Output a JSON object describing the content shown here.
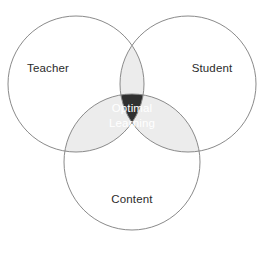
{
  "diagram": {
    "type": "venn-3-circle",
    "title": "",
    "background_color": "#ffffff",
    "stroke_color": "#8a8a8a",
    "circle_fill": "#ffffff",
    "pair_overlap_color": "#ececec",
    "triple_overlap_color": "#303030",
    "label_color": "#2b2b2b",
    "center_label_color": "#ffffff",
    "sets": [
      {
        "id": "teacher",
        "label": "Teacher",
        "position": "top-left",
        "cx": 76,
        "cy": 84,
        "r": 68,
        "label_x": 48,
        "label_y": 72
      },
      {
        "id": "student",
        "label": "Student",
        "position": "top-right",
        "cx": 188,
        "cy": 84,
        "r": 68,
        "label_x": 212,
        "label_y": 72
      },
      {
        "id": "content",
        "label": "Content",
        "position": "bottom",
        "cx": 132,
        "cy": 162,
        "r": 68,
        "label_x": 132,
        "label_y": 203
      }
    ],
    "intersection": {
      "id": "optimal-learning",
      "label_line_1": "Optimal",
      "label_line_2": "Learning",
      "center_x": 132,
      "center_y": 114
    }
  }
}
